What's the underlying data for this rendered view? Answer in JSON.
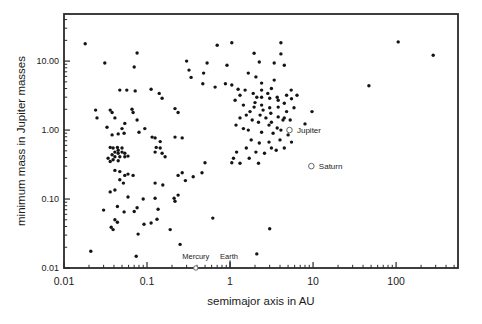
{
  "figure": {
    "background": "#ffffff",
    "dot_color": "#141414",
    "frame_color": "#2a2a2a",
    "text_color": "#1a1a1a",
    "marker_stroke_color": "#666666"
  },
  "chart_data": {
    "type": "scatter",
    "title": "",
    "xlabel": "semimajor axis in AU",
    "ylabel": "minimum mass in Jupiter masses",
    "x_scale": "log",
    "y_scale": "log",
    "xlim": [
      0.01,
      557
    ],
    "ylim": [
      0.01,
      48.2
    ],
    "grid": false,
    "legend": "none",
    "x_ticks": [
      {
        "value": 0.01,
        "label": "0.01"
      },
      {
        "value": 0.1,
        "label": "0.1"
      },
      {
        "value": 1,
        "label": "1"
      },
      {
        "value": 10,
        "label": "10"
      },
      {
        "value": 100,
        "label": "100"
      }
    ],
    "y_ticks": [
      {
        "value": 10,
        "label": "10.00"
      },
      {
        "value": 1,
        "label": "1.00"
      },
      {
        "value": 0.1,
        "label": "0.10"
      },
      {
        "value": 0.01,
        "label": "0.01"
      }
    ],
    "solar_system_markers": [
      {
        "name": "Jupiter",
        "a": 5.2,
        "mass": 1.0,
        "symbol": "open-circle",
        "label_side": "right"
      },
      {
        "name": "Saturn",
        "a": 9.54,
        "mass": 0.3,
        "symbol": "open-circle",
        "label_side": "right"
      },
      {
        "name": "Mercury",
        "a": 0.387,
        "mass": null,
        "symbol": "open-circle-on-axis",
        "label_side": "above"
      },
      {
        "name": "Earth",
        "a": 1.0,
        "mass": null,
        "symbol": "tick-on-axis",
        "label_side": "above"
      }
    ],
    "points": [
      [
        0.018,
        17.8
      ],
      [
        0.031,
        9.4
      ],
      [
        0.076,
        13.1
      ],
      [
        0.07,
        8.2
      ],
      [
        0.3,
        10
      ],
      [
        0.32,
        7.4
      ],
      [
        0.34,
        5.8
      ],
      [
        0.48,
        6.7
      ],
      [
        0.047,
        3.8
      ],
      [
        0.057,
        3.8
      ],
      [
        0.072,
        3.7
      ],
      [
        0.112,
        3.9
      ],
      [
        0.14,
        3.4
      ],
      [
        0.152,
        2.9
      ],
      [
        0.024,
        1.95
      ],
      [
        0.036,
        1.95
      ],
      [
        0.038,
        1.8
      ],
      [
        0.066,
        2.0
      ],
      [
        0.068,
        1.8
      ],
      [
        0.217,
        2.05
      ],
      [
        0.237,
        1.8
      ],
      [
        0.025,
        1.5
      ],
      [
        0.041,
        1.5
      ],
      [
        0.054,
        1.25
      ],
      [
        0.076,
        1.4
      ],
      [
        0.033,
        1.1
      ],
      [
        0.05,
        1.05
      ],
      [
        0.094,
        1.05
      ],
      [
        0.038,
        0.85
      ],
      [
        0.045,
        0.88
      ],
      [
        0.053,
        0.9
      ],
      [
        0.08,
        0.93
      ],
      [
        0.115,
        0.79
      ],
      [
        0.125,
        0.77
      ],
      [
        0.144,
        0.68
      ],
      [
        0.217,
        0.79
      ],
      [
        0.265,
        0.77
      ],
      [
        0.036,
        0.56
      ],
      [
        0.039,
        0.55
      ],
      [
        0.044,
        0.56
      ],
      [
        0.045,
        0.51
      ],
      [
        0.05,
        0.55
      ],
      [
        0.041,
        0.48
      ],
      [
        0.045,
        0.46
      ],
      [
        0.05,
        0.48
      ],
      [
        0.054,
        0.46
      ],
      [
        0.038,
        0.44
      ],
      [
        0.041,
        0.41
      ],
      [
        0.047,
        0.41
      ],
      [
        0.054,
        0.41
      ],
      [
        0.059,
        0.42
      ],
      [
        0.034,
        0.39
      ],
      [
        0.039,
        0.37
      ],
      [
        0.045,
        0.36
      ],
      [
        0.036,
        0.35
      ],
      [
        0.129,
        0.56
      ],
      [
        0.144,
        0.55
      ],
      [
        0.125,
        0.48
      ],
      [
        0.152,
        0.46
      ],
      [
        0.165,
        0.41
      ],
      [
        0.041,
        0.26
      ],
      [
        0.047,
        0.25
      ],
      [
        0.054,
        0.22
      ],
      [
        0.059,
        0.23
      ],
      [
        0.068,
        0.22
      ],
      [
        0.237,
        0.22
      ],
      [
        0.265,
        0.24
      ],
      [
        0.047,
        0.19
      ],
      [
        0.052,
        0.17
      ],
      [
        0.125,
        0.17
      ],
      [
        0.155,
        0.16
      ],
      [
        0.237,
        0.114
      ],
      [
        0.125,
        0.103
      ],
      [
        0.059,
        0.107
      ],
      [
        0.212,
        0.103
      ],
      [
        0.036,
        0.127
      ],
      [
        0.041,
        0.135
      ],
      [
        0.09,
        0.1
      ],
      [
        0.076,
        0.075
      ],
      [
        0.07,
        0.066
      ],
      [
        0.03,
        0.069
      ],
      [
        0.053,
        0.065
      ],
      [
        0.136,
        0.071
      ],
      [
        0.217,
        0.093
      ],
      [
        0.044,
        0.078
      ],
      [
        0.041,
        0.05
      ],
      [
        0.044,
        0.046
      ],
      [
        0.037,
        0.039
      ],
      [
        0.039,
        0.036
      ],
      [
        0.092,
        0.043
      ],
      [
        0.112,
        0.045
      ],
      [
        0.132,
        0.051
      ],
      [
        0.078,
        0.031
      ],
      [
        0.19,
        0.036
      ],
      [
        0.25,
        0.022
      ],
      [
        0.021,
        0.0175
      ],
      [
        0.074,
        0.0148
      ],
      [
        0.29,
        0.185
      ],
      [
        0.36,
        0.21
      ],
      [
        0.46,
        0.24
      ],
      [
        0.5,
        0.335
      ],
      [
        0.7,
        17
      ],
      [
        1.05,
        18.5
      ],
      [
        0.53,
        9.4
      ],
      [
        0.92,
        8.7
      ],
      [
        0.47,
        4.7
      ],
      [
        0.66,
        4.2
      ],
      [
        0.88,
        4.7
      ],
      [
        1.05,
        4.5
      ],
      [
        1.25,
        3.9
      ],
      [
        4.1,
        18.5
      ],
      [
        1.95,
        13
      ],
      [
        4.1,
        12.7
      ],
      [
        2.25,
        9.7
      ],
      [
        3.4,
        9.4
      ],
      [
        4.5,
        8.7
      ],
      [
        1.66,
        6.7
      ],
      [
        2.05,
        5.9
      ],
      [
        2.4,
        4.8
      ],
      [
        3.4,
        5.3
      ],
      [
        5.45,
        3.8
      ],
      [
        1.52,
        3.8
      ],
      [
        1.9,
        3.4
      ],
      [
        2.4,
        3.0
      ],
      [
        3.0,
        2.9
      ],
      [
        3.8,
        2.7
      ],
      [
        4.5,
        2.45
      ],
      [
        1.95,
        2.15
      ],
      [
        2.5,
        1.95
      ],
      [
        3.1,
        1.75
      ],
      [
        1.57,
        1.65
      ],
      [
        3.8,
        1.55
      ],
      [
        4.5,
        1.5
      ],
      [
        2.2,
        1.3
      ],
      [
        2.95,
        1.18
      ],
      [
        1.66,
        1.0
      ],
      [
        2.4,
        0.93
      ],
      [
        3.3,
        0.9
      ],
      [
        4.1,
        1.0
      ],
      [
        1.8,
        0.72
      ],
      [
        2.25,
        0.65
      ],
      [
        2.95,
        0.67
      ],
      [
        1.57,
        0.55
      ],
      [
        2.05,
        0.48
      ],
      [
        2.6,
        0.46
      ],
      [
        3.6,
        0.51
      ],
      [
        4.5,
        0.55
      ],
      [
        1.7,
        0.39
      ],
      [
        1.32,
        3.2
      ],
      [
        1.15,
        2.7
      ],
      [
        1.45,
        2.3
      ],
      [
        1.74,
        1.85
      ],
      [
        1.32,
        1.5
      ],
      [
        1.18,
        1.18
      ],
      [
        1.45,
        1.05
      ],
      [
        1.85,
        1.4
      ],
      [
        2.7,
        1.5
      ],
      [
        3.15,
        1.3
      ],
      [
        2.3,
        1.65
      ],
      [
        4.8,
        1.85
      ],
      [
        5.3,
        1.4
      ],
      [
        5.9,
        2.1
      ],
      [
        6.4,
        3.2
      ],
      [
        5.5,
        2.85
      ],
      [
        4.8,
        3.2
      ],
      [
        3.7,
        3.0
      ],
      [
        2.85,
        3.4
      ],
      [
        3.15,
        4.0
      ],
      [
        2.4,
        3.8
      ],
      [
        2.1,
        3.0
      ],
      [
        2.4,
        2.3
      ],
      [
        2.0,
        2.5
      ],
      [
        3.0,
        2.1
      ],
      [
        3.8,
        2.15
      ],
      [
        4.35,
        1.4
      ],
      [
        3.7,
        1.07
      ],
      [
        5.0,
        0.85
      ],
      [
        4.0,
        0.72
      ],
      [
        3.15,
        0.55
      ],
      [
        5.5,
        0.67
      ],
      [
        1.2,
        0.48
      ],
      [
        1.1,
        0.39
      ],
      [
        1.32,
        0.33
      ],
      [
        1.05,
        0.335
      ],
      [
        2.2,
        0.33
      ],
      [
        0.62,
        0.053
      ],
      [
        3.0,
        0.037
      ],
      [
        2.1,
        0.016
      ],
      [
        9.7,
        1.85
      ],
      [
        8.0,
        1.23
      ],
      [
        47,
        4.4
      ],
      [
        106,
        19
      ],
      [
        280,
        12.2
      ]
    ]
  }
}
